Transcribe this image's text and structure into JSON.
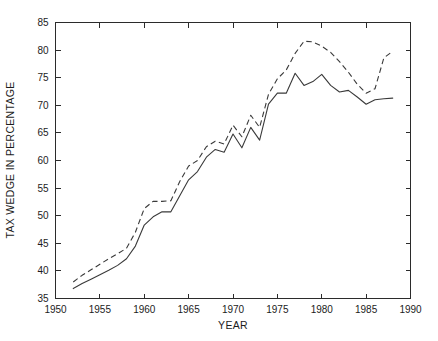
{
  "chart_data": {
    "type": "line",
    "title": "",
    "xlabel": "YEAR",
    "ylabel": "TAX WEDGE IN PERCENTAGE",
    "xlim": [
      1950,
      1990
    ],
    "ylim": [
      35,
      85
    ],
    "xticks": [
      1950,
      1955,
      1960,
      1965,
      1970,
      1975,
      1980,
      1985,
      1990
    ],
    "yticks": [
      35,
      40,
      45,
      50,
      55,
      60,
      65,
      70,
      75,
      80,
      85
    ],
    "grid": false,
    "legend": "none",
    "series": [
      {
        "name": "solid-series",
        "style": "solid",
        "color": "#3a3a3a",
        "x": [
          1952,
          1953,
          1954,
          1955,
          1956,
          1957,
          1958,
          1959,
          1960,
          1961,
          1962,
          1963,
          1964,
          1965,
          1966,
          1967,
          1968,
          1969,
          1970,
          1971,
          1972,
          1973,
          1974,
          1975,
          1976,
          1977,
          1978,
          1979,
          1980,
          1981,
          1982,
          1983,
          1984,
          1985,
          1986,
          1987,
          1988
        ],
        "y": [
          36.8,
          37.7,
          38.5,
          39.3,
          40.1,
          41.0,
          42.2,
          44.5,
          48.3,
          49.8,
          50.7,
          50.7,
          53.6,
          56.5,
          58.0,
          60.6,
          62.0,
          61.5,
          64.8,
          62.3,
          66.0,
          63.7,
          70.2,
          72.2,
          72.2,
          75.8,
          73.6,
          74.3,
          75.6,
          73.6,
          72.4,
          72.7,
          71.5,
          70.2,
          71.0,
          71.2,
          71.3
        ]
      },
      {
        "name": "dashed-series",
        "style": "dashed",
        "color": "#3a3a3a",
        "x": [
          1952,
          1953,
          1954,
          1955,
          1956,
          1957,
          1958,
          1959,
          1960,
          1961,
          1962,
          1963,
          1964,
          1965,
          1966,
          1967,
          1968,
          1969,
          1970,
          1971,
          1972,
          1973,
          1974,
          1975,
          1976,
          1977,
          1978,
          1979,
          1980,
          1981,
          1982,
          1983,
          1984,
          1985,
          1986,
          1987,
          1988
        ],
        "y": [
          38.0,
          39.2,
          40.2,
          41.2,
          42.2,
          43.1,
          44.1,
          47.0,
          51.3,
          52.6,
          52.6,
          52.7,
          56.2,
          59.0,
          60.0,
          62.5,
          63.5,
          63.0,
          66.4,
          64.3,
          68.2,
          66.0,
          72.0,
          74.8,
          76.4,
          79.4,
          81.6,
          81.5,
          80.7,
          79.6,
          77.9,
          76.0,
          73.8,
          72.2,
          73.0,
          78.6,
          79.8
        ]
      }
    ]
  }
}
